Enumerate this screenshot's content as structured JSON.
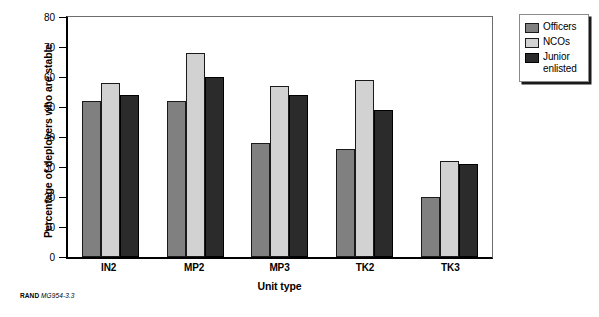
{
  "chart_data": {
    "type": "bar",
    "title": "",
    "xlabel": "Unit type",
    "ylabel": "Percentage of deployers who are stable",
    "categories": [
      "IN2",
      "MP2",
      "MP3",
      "TK2",
      "TK3"
    ],
    "series": [
      {
        "name": "Officers",
        "color": "#808080",
        "values": [
          52,
          52,
          38,
          36,
          20
        ]
      },
      {
        "name": "NCOs",
        "color": "#d2d2d2",
        "values": [
          58,
          68,
          57,
          59,
          32
        ]
      },
      {
        "name": "Junior enlisted",
        "color": "#2b2b2b",
        "values": [
          54,
          60,
          54,
          49,
          31
        ]
      }
    ],
    "ylim": [
      0,
      80
    ],
    "yticks": [
      0,
      10,
      20,
      30,
      40,
      50,
      60,
      70,
      80
    ],
    "ytick_labels": [
      "0",
      "10",
      "20",
      "30",
      "40",
      "50",
      "60",
      "70",
      "80"
    ],
    "grid": false,
    "legend_position": "right-top"
  },
  "legend": {
    "entries": [
      {
        "label": "Officers",
        "swatch": "legend-swatch-officers"
      },
      {
        "label": "NCOs",
        "swatch": "legend-swatch-ncos"
      },
      {
        "label": "Junior\nenlisted",
        "label_line1": "Junior",
        "label_line2": "enlisted",
        "swatch": "legend-swatch-junior-enlisted"
      }
    ]
  },
  "caption": {
    "prefix": "RAND",
    "figure_id": "MG954-3.3"
  }
}
